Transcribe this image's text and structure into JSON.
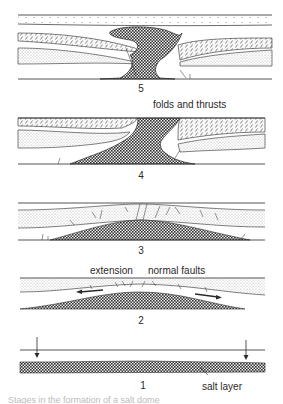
{
  "figure": {
    "panels": [
      {
        "id": 5,
        "label": "5",
        "annotation": ""
      },
      {
        "id": 4,
        "label": "4",
        "annotation": "folds and thrusts"
      },
      {
        "id": 3,
        "label": "3",
        "annotation": ""
      },
      {
        "id": 2,
        "label": "2",
        "annotation_left": "extension",
        "annotation_right": "normal faults"
      },
      {
        "id": 1,
        "label": "1",
        "annotation": "salt layer"
      }
    ],
    "colors": {
      "line": "#2a2a2a",
      "salt": "#3a3a3a",
      "stipple": "#9a9a9a",
      "background": "#ffffff"
    },
    "caption_cropped": "Stages in the formation of a salt dome"
  }
}
